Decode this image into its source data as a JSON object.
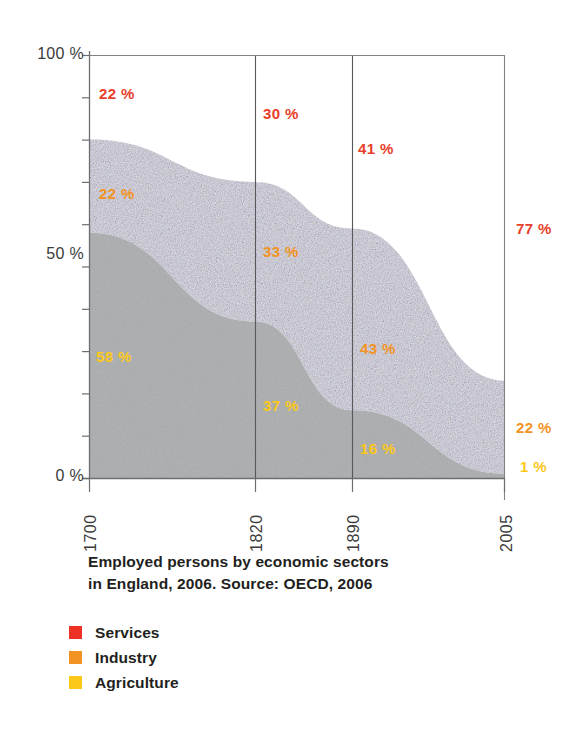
{
  "chart_data": {
    "type": "area",
    "title": "",
    "caption_line1": "Employed persons by economic sectors",
    "caption_line2": "in England, 2006. Source: OECD, 2006",
    "xlabel": "",
    "ylabel": "",
    "x": [
      1700,
      1820,
      1890,
      2005
    ],
    "xtick_labels": [
      "1700",
      "1820",
      "1890",
      "2005"
    ],
    "ylim": [
      0,
      100
    ],
    "ytick_labels": [
      "0 %",
      "50 %",
      "100 %"
    ],
    "ytick_values": [
      0,
      50,
      100
    ],
    "yminor_step": 10,
    "grid": "vertical-only",
    "legend_position": "below-caption",
    "stacked": true,
    "stack_order_bottom_to_top": [
      "Agriculture",
      "Industry",
      "Services"
    ],
    "series": [
      {
        "name": "Services",
        "color": "#ed3124",
        "values": [
          20,
          30,
          41,
          77
        ],
        "fill": "#ffffff",
        "labels": [
          "22 %",
          "30 %",
          "41 %",
          "77 %"
        ]
      },
      {
        "name": "Industry",
        "color": "#f39324",
        "values": [
          22,
          33,
          43,
          22
        ],
        "fill": "#e4e3ef",
        "labels": [
          "22 %",
          "33 %",
          "43 %",
          "22 %"
        ]
      },
      {
        "name": "Agriculture",
        "color": "#fcc818",
        "values": [
          58,
          37,
          16,
          1
        ],
        "fill": "#b3b4b6",
        "labels": [
          "58 %",
          "37 %",
          "16 %",
          "1 %"
        ]
      }
    ],
    "annotations": [
      {
        "text": "22 %",
        "series": "Services",
        "x": 1700,
        "color": "#e8402a"
      },
      {
        "text": "30 %",
        "series": "Services",
        "x": 1820,
        "color": "#e8402a"
      },
      {
        "text": "41 %",
        "series": "Services",
        "x": 1890,
        "color": "#e8402a"
      },
      {
        "text": "77 %",
        "series": "Services",
        "x": 2005,
        "color": "#e8402a"
      },
      {
        "text": "22 %",
        "series": "Industry",
        "x": 1700,
        "color": "#f39324"
      },
      {
        "text": "33 %",
        "series": "Industry",
        "x": 1820,
        "color": "#f39324"
      },
      {
        "text": "43 %",
        "series": "Industry",
        "x": 1890,
        "color": "#f39324"
      },
      {
        "text": "22 %",
        "series": "Industry",
        "x": 2005,
        "color": "#f39324"
      },
      {
        "text": "58 %",
        "series": "Agriculture",
        "x": 1700,
        "color": "#fcc818"
      },
      {
        "text": "37 %",
        "series": "Agriculture",
        "x": 1820,
        "color": "#fcc818"
      },
      {
        "text": "16 %",
        "series": "Agriculture",
        "x": 1890,
        "color": "#fcc818"
      },
      {
        "text": "1 %",
        "series": "Agriculture",
        "x": 2005,
        "color": "#fcc818"
      }
    ]
  },
  "axes": {
    "y": {
      "label_100": "100 %",
      "label_50": "50 %",
      "label_0": "0 %"
    },
    "x": {
      "t1": "1700",
      "t2": "1820",
      "t3": "1890",
      "t4": "2005"
    }
  },
  "plot_labels": {
    "services_1700": "22 %",
    "services_1820": "30 %",
    "services_1890": "41 %",
    "services_2005": "77 %",
    "industry_1700": "22 %",
    "industry_1820": "33 %",
    "industry_1890": "43 %",
    "industry_2005": "22 %",
    "agriculture_1700": "58 %",
    "agriculture_1820": "37 %",
    "agriculture_1890": "16 %",
    "agriculture_2005": "1 %"
  },
  "caption": {
    "line1": "Employed persons by economic sectors",
    "line2": "in England, 2006. Source: OECD, 2006"
  },
  "legend": {
    "items": [
      {
        "label": "Services",
        "color": "#ed3124"
      },
      {
        "label": "Industry",
        "color": "#f39324"
      },
      {
        "label": "Agriculture",
        "color": "#fcc818"
      }
    ]
  },
  "colors": {
    "services": "#ed3124",
    "industry": "#f39324",
    "agriculture": "#fcc818",
    "area_services": "#ffffff",
    "area_industry": "#e4e3ef",
    "area_agriculture": "#b3b4b6",
    "axis": "#6d6e71",
    "text": "#231f20"
  }
}
